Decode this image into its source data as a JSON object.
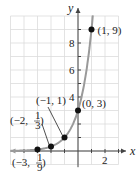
{
  "chart_data": {
    "type": "line",
    "title": "",
    "function": "y = 3^(x+1)",
    "xlabel": "x",
    "ylabel": "y",
    "xlim": [
      -5,
      3
    ],
    "ylim": [
      -1,
      10
    ],
    "grid": true,
    "x_ticks": [
      {
        "value": 2,
        "label": "2"
      }
    ],
    "y_ticks": [
      {
        "value": 4,
        "label": "4"
      },
      {
        "value": 6,
        "label": "6"
      },
      {
        "value": 8,
        "label": "8"
      }
    ],
    "points": [
      {
        "x": -3,
        "y": 0.1111,
        "label": "(−3, 1/9)",
        "label_num": "−3,",
        "frac_num": "1",
        "frac_den": "9"
      },
      {
        "x": -2,
        "y": 0.3333,
        "label": "(−2, 1/3)",
        "label_num": "−2,",
        "frac_num": "1",
        "frac_den": "3"
      },
      {
        "x": -1,
        "y": 1,
        "label": "(−1, 1)"
      },
      {
        "x": 0,
        "y": 3,
        "label": "(0, 3)"
      },
      {
        "x": 1,
        "y": 9,
        "label": "(1, 9)"
      }
    ],
    "colors": {
      "curve": "#9a9a9a",
      "points": "#111111",
      "grid": "#dcdcdc",
      "axes": "#444444"
    }
  }
}
